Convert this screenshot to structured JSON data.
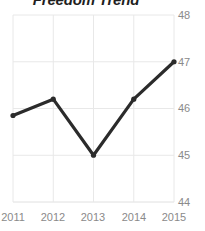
{
  "chart_data": {
    "type": "line",
    "title": "Freedom Trend",
    "xlabel": "",
    "ylabel": "",
    "categories": [
      "2011",
      "2012",
      "2013",
      "2014",
      "2015"
    ],
    "x": [
      2011,
      2012,
      2013,
      2014,
      2015
    ],
    "values": [
      45.85,
      46.2,
      45.0,
      46.2,
      47.0
    ],
    "series": [
      {
        "name": "Freedom Trend",
        "values": [
          45.85,
          46.2,
          45.0,
          46.2,
          47.0
        ]
      }
    ],
    "ylim": [
      44,
      48
    ],
    "xlim": [
      2011,
      2015
    ],
    "yticks": [
      "48",
      "47",
      "46",
      "45",
      "44"
    ],
    "ytick_values": [
      48,
      47,
      46,
      45,
      44
    ],
    "xticks": [
      "2011",
      "2012",
      "2013",
      "2014",
      "2015"
    ],
    "grid": true,
    "grid_color": "#e8e8e8",
    "legend": false,
    "legend_position": "none",
    "line_color": "#2b2b2b",
    "marker": "circle",
    "marker_color": "#2b2b2b",
    "tick_label_color": "#8a8a8a",
    "title_color": "#1f1f1f",
    "background_color": "#ffffff"
  }
}
